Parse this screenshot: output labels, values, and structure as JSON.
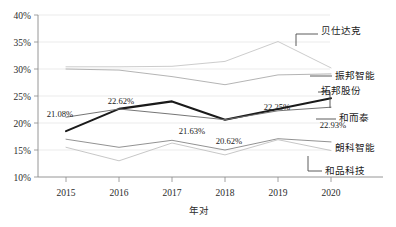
{
  "chart_data": {
    "type": "line",
    "title": "",
    "xlabel": "年对",
    "ylabel": "",
    "x": [
      "2015",
      "2016",
      "2017",
      "2018",
      "2019",
      "2020"
    ],
    "ylim": [
      10,
      40
    ],
    "yticks": [
      "10%",
      "15%",
      "20%",
      "25%",
      "30%",
      "35%",
      "40%"
    ],
    "grid": true,
    "legend_position": "right-inline-callouts",
    "series": [
      {
        "name": "贝仕达克",
        "color": "#c9c9c9",
        "values": [
          30.4,
          30.4,
          30.5,
          31.4,
          35.1,
          30.2
        ]
      },
      {
        "name": "振邦智能",
        "color": "#b0b0b0",
        "values": [
          30.0,
          29.8,
          28.6,
          27.1,
          28.9,
          29.1
        ]
      },
      {
        "name": "拓邦股份",
        "color": "#1a1a1a",
        "values": [
          18.5,
          22.62,
          24.0,
          20.62,
          22.6,
          24.6
        ],
        "labels": [
          "",
          "22.62%",
          "",
          "20.62%",
          "",
          ""
        ]
      },
      {
        "name": "和而泰",
        "color": "#6e6e6e",
        "values": [
          21.08,
          22.6,
          21.63,
          20.62,
          22.25,
          22.93
        ],
        "labels": [
          "21.08%",
          "",
          "21.63%",
          "",
          "22.25%",
          "22.93%"
        ]
      },
      {
        "name": "朗科智能",
        "color": "#8c8c8c",
        "values": [
          17.0,
          15.5,
          16.8,
          15.0,
          17.1,
          16.5
        ]
      },
      {
        "name": "和品科技",
        "color": "#c4c4c4",
        "values": [
          15.5,
          13.0,
          16.3,
          14.1,
          16.9,
          14.9
        ]
      }
    ],
    "data_labels": [
      {
        "text": "21.08%",
        "x": 2015,
        "y": 21.08
      },
      {
        "text": "22.62%",
        "x": 2016,
        "y": 22.62
      },
      {
        "text": "21.63%",
        "x": 2017,
        "y": 21.63
      },
      {
        "text": "20.62%",
        "x": 2018,
        "y": 20.62
      },
      {
        "text": "22.25%",
        "x": 2019,
        "y": 22.25
      },
      {
        "text": "22.93%",
        "x": 2020,
        "y": 22.93
      }
    ],
    "callouts": [
      {
        "label": "贝仕达克"
      },
      {
        "label": "振邦智能"
      },
      {
        "label": "拓邦股份"
      },
      {
        "label": "和而泰"
      },
      {
        "label": "朗科智能"
      },
      {
        "label": "和品科技"
      }
    ]
  }
}
